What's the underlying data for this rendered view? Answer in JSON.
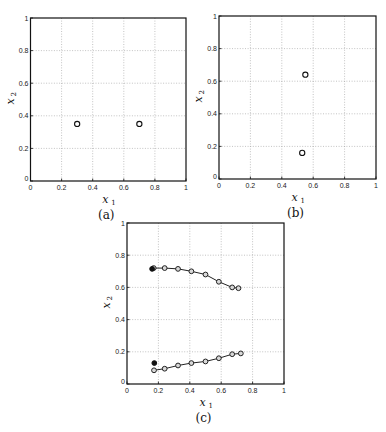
{
  "chart_data": [
    {
      "id": "a",
      "type": "scatter",
      "caption": "(a)",
      "xlabel": "x",
      "xlabel_sub": "1",
      "ylabel": "x",
      "ylabel_sub": "2",
      "xlim": [
        0,
        1
      ],
      "ylim": [
        0,
        1
      ],
      "xticks": [
        "0",
        "0.2",
        "0.4",
        "0.6",
        "0.8",
        "1"
      ],
      "yticks": [
        "0",
        "0.2",
        "0.4",
        "0.6",
        "0.8",
        "1"
      ],
      "grid": true,
      "series": [
        {
          "name": "points",
          "marker": "open-circle",
          "line": false,
          "points": [
            [
              0.3,
              0.35
            ],
            [
              0.7,
              0.35
            ]
          ]
        }
      ]
    },
    {
      "id": "b",
      "type": "scatter",
      "caption": "(b)",
      "xlabel": "x",
      "xlabel_sub": "1",
      "ylabel": "x",
      "ylabel_sub": "2",
      "xlim": [
        0,
        1
      ],
      "ylim": [
        0,
        1
      ],
      "xticks": [
        "0",
        "0.2",
        "0.4",
        "0.6",
        "0.8",
        "1"
      ],
      "yticks": [
        "0",
        "0.2",
        "0.4",
        "0.6",
        "0.8",
        "1"
      ],
      "grid": true,
      "series": [
        {
          "name": "points",
          "marker": "open-circle",
          "line": false,
          "points": [
            [
              0.55,
              0.64
            ],
            [
              0.53,
              0.16
            ]
          ]
        }
      ]
    },
    {
      "id": "c",
      "type": "line",
      "caption": "(c)",
      "xlabel": "x",
      "xlabel_sub": "1",
      "ylabel": "x",
      "ylabel_sub": "2",
      "xlim": [
        0,
        1
      ],
      "ylim": [
        0,
        1
      ],
      "xticks": [
        "0",
        "0.2",
        "0.4",
        "0.6",
        "0.8",
        "1"
      ],
      "yticks": [
        "0",
        "0.2",
        "0.4",
        "0.6",
        "0.8",
        "1"
      ],
      "grid": true,
      "series": [
        {
          "name": "upper-trajectory",
          "marker": "gray-circle",
          "line": true,
          "points": [
            [
              0.17,
              0.72
            ],
            [
              0.24,
              0.72
            ],
            [
              0.325,
              0.715
            ],
            [
              0.41,
              0.7
            ],
            [
              0.5,
              0.68
            ],
            [
              0.585,
              0.635
            ],
            [
              0.67,
              0.6
            ],
            [
              0.71,
              0.595
            ]
          ]
        },
        {
          "name": "upper-start",
          "marker": "filled-circle",
          "line": false,
          "points": [
            [
              0.16,
              0.715
            ]
          ]
        },
        {
          "name": "lower-trajectory",
          "marker": "gray-circle",
          "line": true,
          "points": [
            [
              0.172,
              0.085
            ],
            [
              0.24,
              0.095
            ],
            [
              0.325,
              0.115
            ],
            [
              0.41,
              0.13
            ],
            [
              0.5,
              0.14
            ],
            [
              0.585,
              0.16
            ],
            [
              0.67,
              0.185
            ],
            [
              0.725,
              0.19
            ]
          ]
        },
        {
          "name": "lower-start",
          "marker": "filled-circle",
          "line": false,
          "points": [
            [
              0.174,
              0.13
            ]
          ]
        }
      ]
    }
  ]
}
